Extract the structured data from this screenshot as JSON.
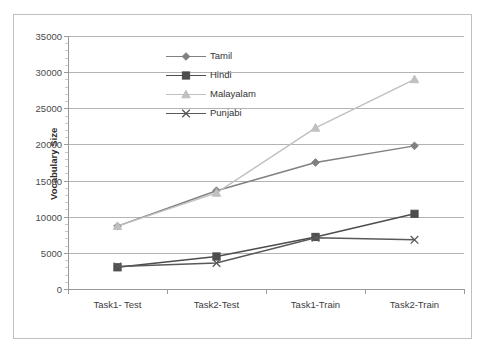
{
  "chart_data": {
    "type": "line",
    "title": "",
    "xlabel": "",
    "ylabel": "Vocabulary Size",
    "categories": [
      "Task1- Test",
      "Task2-Test",
      "Task1-Train",
      "Task2-Train"
    ],
    "ylim": [
      0,
      35000
    ],
    "ytick_step": 5000,
    "ytick_labels": [
      "0",
      "5000",
      "10000",
      "15000",
      "20000",
      "25000",
      "30000",
      "35000"
    ],
    "ytick_values": [
      0,
      5000,
      10000,
      15000,
      20000,
      25000,
      30000,
      35000
    ],
    "grid": true,
    "legend_position": "inside-top-center",
    "series": [
      {
        "name": "Tamil",
        "values": [
          8700,
          13600,
          17500,
          19800
        ],
        "marker": "diamond",
        "color": "#808080"
      },
      {
        "name": "Hindi",
        "values": [
          3000,
          4500,
          7200,
          10400
        ],
        "marker": "square",
        "color": "#4d4d4d"
      },
      {
        "name": "Malayalam",
        "values": [
          8700,
          13300,
          22300,
          29000
        ],
        "marker": "triangle",
        "color": "#c0c0c0"
      },
      {
        "name": "Punjabi",
        "values": [
          3100,
          3600,
          7100,
          6800
        ],
        "marker": "cross",
        "color": "#595959"
      }
    ]
  },
  "legend": {
    "items": [
      {
        "label": "Tamil"
      },
      {
        "label": "Hindi"
      },
      {
        "label": "Malayalam"
      },
      {
        "label": "Punjabi"
      }
    ]
  },
  "axes": {
    "y_title": "Vocabulary Size"
  }
}
